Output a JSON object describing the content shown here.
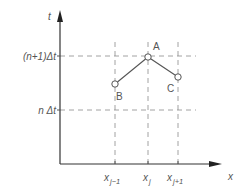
{
  "diagram": {
    "axes": {
      "y_label": "t",
      "x_label": "x"
    },
    "y_levels": [
      {
        "label": "(n+1)Δt",
        "y": 56
      },
      {
        "label": "n Δt",
        "y": 110
      }
    ],
    "x_ticks": [
      {
        "base": "x",
        "sub": "j−1",
        "x": 115
      },
      {
        "base": "x",
        "sub": "j",
        "x": 148
      },
      {
        "base": "x",
        "sub": "j+1",
        "x": 178
      }
    ],
    "points": [
      {
        "name": "A",
        "x": 148,
        "y": 57
      },
      {
        "name": "B",
        "x": 115,
        "y": 84
      },
      {
        "name": "C",
        "x": 178,
        "y": 77
      }
    ],
    "colors": {
      "axis": "#333333",
      "dashed": "#888888",
      "line": "#555555",
      "text": "#555555"
    }
  }
}
